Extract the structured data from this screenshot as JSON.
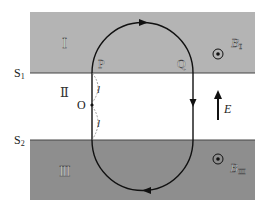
{
  "regions": {
    "I": {
      "label": "Ⅰ",
      "field_label": "B",
      "field_sub": "Ⅰ",
      "color": "#b4b4b4"
    },
    "II": {
      "label": "Ⅱ",
      "field_label": "E",
      "color": "#ffffff"
    },
    "III": {
      "label": "Ⅲ",
      "field_label": "B",
      "field_sub": "Ⅲ",
      "color": "#8c8c8c"
    }
  },
  "boundaries": {
    "S1": {
      "label": "S",
      "sub": "1"
    },
    "S2": {
      "label": "S",
      "sub": "2"
    }
  },
  "points": {
    "P": "P",
    "Q": "Q",
    "O": "O"
  },
  "distances": {
    "upper": "l",
    "lower": "l"
  }
}
